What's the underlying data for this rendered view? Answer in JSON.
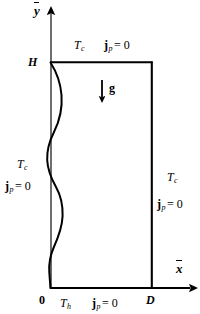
{
  "figure": {
    "type": "schematic-diagram",
    "background_color": "#ffffff",
    "line_color": "#000000"
  },
  "axes": {
    "x_axis": {
      "label": "x",
      "overbar": true,
      "name": "x-axis",
      "arrow": "right"
    },
    "y_axis": {
      "label": "y",
      "overbar": true,
      "name": "y-axis",
      "arrow": "up"
    }
  },
  "points": {
    "origin": "0",
    "height": "H",
    "width": "D"
  },
  "gravity": {
    "label": "g",
    "direction": "down"
  },
  "boundary_conditions": {
    "top": {
      "temperature": "T",
      "temperature_sub": "c",
      "flux": "j",
      "flux_sub": "p",
      "flux_value": "= 0"
    },
    "left": {
      "temperature": "T",
      "temperature_sub": "c",
      "flux": "j",
      "flux_sub": "p",
      "flux_value": "= 0"
    },
    "right": {
      "temperature": "T",
      "temperature_sub": "c",
      "flux": "j",
      "flux_sub": "p",
      "flux_value": "= 0"
    },
    "bottom": {
      "temperature": "T",
      "temperature_sub": "h",
      "flux": "j",
      "flux_sub": "p",
      "flux_value": "= 0"
    }
  }
}
